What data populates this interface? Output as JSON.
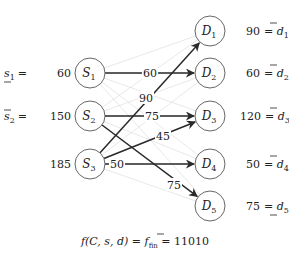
{
  "sources": [
    {
      "id": "S1",
      "name": "S",
      "sub": "1",
      "x": 90,
      "y": 73,
      "lhs_var": "s",
      "lhs_sub": "1",
      "lhs_bar": "under",
      "value": "60",
      "side_text": "= 60"
    },
    {
      "id": "S2",
      "name": "S",
      "sub": "2",
      "x": 90,
      "y": 116,
      "lhs_var": "s",
      "lhs_sub": "2",
      "lhs_bar": "over",
      "value": "150",
      "side_text": "= 150"
    },
    {
      "id": "S3",
      "name": "S",
      "sub": "3",
      "x": 90,
      "y": 164,
      "lhs_var": "",
      "lhs_sub": "",
      "lhs_bar": "none",
      "value": "185",
      "side_text": "185"
    }
  ],
  "demands": [
    {
      "id": "D1",
      "name": "D",
      "sub": "1",
      "x": 210,
      "y": 31,
      "value": "90",
      "rhs_var": "d",
      "rhs_sub": "1",
      "rhs_bar": "over"
    },
    {
      "id": "D2",
      "name": "D",
      "sub": "2",
      "x": 210,
      "y": 73,
      "value": "60",
      "rhs_var": "d",
      "rhs_sub": "2",
      "rhs_bar": "over"
    },
    {
      "id": "D3",
      "name": "D",
      "sub": "3",
      "x": 210,
      "y": 116,
      "value": "120",
      "rhs_var": "d",
      "rhs_sub": "3",
      "rhs_bar": "over"
    },
    {
      "id": "D4",
      "name": "D",
      "sub": "4",
      "x": 210,
      "y": 164,
      "value": "50",
      "rhs_var": "d",
      "rhs_sub": "4",
      "rhs_bar": "over"
    },
    {
      "id": "D5",
      "name": "D",
      "sub": "5",
      "x": 210,
      "y": 206,
      "value": "75",
      "rhs_var": "d",
      "rhs_sub": "5",
      "rhs_bar": "under"
    }
  ],
  "flows": [
    {
      "from": "S1",
      "to": "D2",
      "label": "60",
      "lx": 150,
      "ly": 73
    },
    {
      "from": "S3",
      "to": "D1",
      "label": "90",
      "lx": 146,
      "ly": 98
    },
    {
      "from": "S2",
      "to": "D3",
      "label": "75",
      "lx": 152,
      "ly": 116
    },
    {
      "from": "S3",
      "to": "D3",
      "label": "45",
      "lx": 163,
      "ly": 136
    },
    {
      "from": "S3",
      "to": "D4",
      "label": "50",
      "lx": 117,
      "ly": 164
    },
    {
      "from": "S2",
      "to": "D5",
      "label": "75",
      "lx": 174,
      "ly": 185
    }
  ],
  "formula": {
    "lhs": "f(C, s, d) = ",
    "mid": "f",
    "mid_sub": "fin",
    "rhs": " = 11010"
  },
  "colors": {
    "edge": "#2a2a2a",
    "faint_edge": "#d9d9d9",
    "node_stroke": "#555555"
  }
}
